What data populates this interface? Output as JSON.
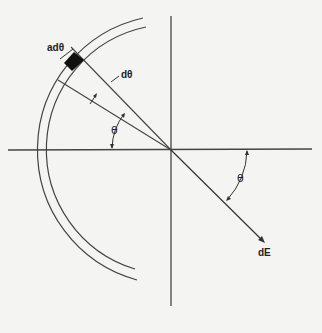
{
  "figure": {
    "labels": {
      "arc_element": "adθ",
      "small_angle": "dθ",
      "theta_left": "θ",
      "theta_right": "θ",
      "field": "dE"
    },
    "geometry": {
      "center": [
        171,
        150
      ],
      "inner_radius": 125,
      "outer_radius": 135,
      "theta_deg": 38.6,
      "dtheta_deg": 7,
      "arc_start_deg": 100,
      "arc_end_deg": 245
    },
    "colors": {
      "line": "#333333",
      "background": "#f4f4f2",
      "element": "#111111"
    }
  }
}
